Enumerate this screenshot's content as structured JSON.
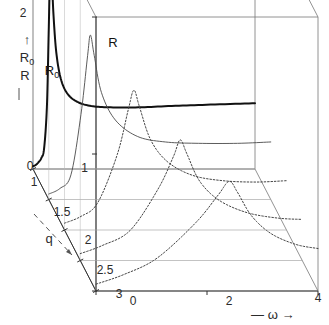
{
  "figure": {
    "type": "3d-waterfall-resonance-plot",
    "background": "#ffffff",
    "line_color": "#111111",
    "thin_line_color": "#4a4a4a",
    "box_color": "#777777"
  },
  "axes": {
    "y": {
      "label_top": "R",
      "label_top_sub": "0",
      "label_bottom": "R",
      "label_arrow": "↑",
      "ticks": [
        {
          "value": 2,
          "text": "2"
        },
        {
          "value": 1,
          "text": "1"
        },
        {
          "value": 0,
          "text": "0"
        }
      ],
      "range": [
        0,
        2
      ]
    },
    "x": {
      "label": "ω",
      "label_prefix": "—",
      "label_suffix": "→",
      "ticks": [
        {
          "value": 0,
          "text": "0"
        },
        {
          "value": 2,
          "text": "2"
        },
        {
          "value": 4,
          "text": "4"
        }
      ],
      "range": [
        0,
        4
      ]
    },
    "q": {
      "label": "q",
      "label_arrow": "↘",
      "ticks": [
        {
          "value": 1,
          "text": "1"
        },
        {
          "value": 1.5,
          "text": "1.5"
        },
        {
          "value": 2,
          "text": "2"
        },
        {
          "value": 2.5,
          "text": "2.5"
        },
        {
          "value": 3,
          "text": "3"
        }
      ],
      "range": [
        1,
        3
      ]
    }
  },
  "curve_labels": [
    {
      "name": "R-label",
      "text": "R",
      "x": 113,
      "y": 47
    },
    {
      "name": "R0-label",
      "text": "R",
      "sub": "0",
      "x": 52,
      "y": 75
    }
  ],
  "chart_data": {
    "type": "line",
    "title": "",
    "xlabel": "ω",
    "ylabel": "R0 / R",
    "zlabel": "q",
    "xlim": [
      0,
      4
    ],
    "ylim": [
      0,
      2
    ],
    "zlim": [
      1,
      3
    ],
    "grid": false,
    "legend": "none",
    "projection": "oblique-3d",
    "series": [
      {
        "name": "q=1 (R0, bold front slice)",
        "q": 1,
        "style": "solid-bold",
        "peak_omega": 0.32,
        "peak_value": 1.45,
        "x": [
          0.0,
          0.05,
          0.1,
          0.15,
          0.2,
          0.25,
          0.28,
          0.3,
          0.32,
          0.34,
          0.37,
          0.42,
          0.5,
          0.62,
          0.8,
          1.05,
          1.4,
          1.9,
          2.5,
          3.2,
          4.0
        ],
        "y": [
          0.02,
          0.03,
          0.05,
          0.08,
          0.15,
          0.45,
          0.95,
          1.3,
          1.45,
          1.38,
          1.12,
          0.85,
          0.66,
          0.55,
          0.49,
          0.46,
          0.45,
          0.45,
          0.46,
          0.47,
          0.48
        ]
      },
      {
        "name": "q=1 (R, thin flat slice)",
        "q": 1,
        "style": "solid-thin",
        "peak_omega": 0.3,
        "peak_value": 1.72,
        "x": [
          0.0,
          0.1,
          0.2,
          0.26,
          0.3,
          0.36,
          0.5,
          0.8,
          1.4,
          2.2,
          3.0,
          4.0
        ],
        "y": [
          2.0,
          2.0,
          1.98,
          1.9,
          1.78,
          1.7,
          1.68,
          1.67,
          1.67,
          1.67,
          1.67,
          1.67
        ]
      },
      {
        "name": "q=1.5",
        "q": 1.5,
        "style": "solid-thin",
        "peak_omega": 0.75,
        "peak_value": 1.2,
        "x": [
          0.0,
          0.2,
          0.4,
          0.58,
          0.7,
          0.75,
          0.82,
          0.95,
          1.2,
          1.6,
          2.1,
          2.7,
          3.4,
          4.0
        ],
        "y": [
          0.04,
          0.08,
          0.18,
          0.62,
          1.05,
          1.2,
          1.05,
          0.78,
          0.58,
          0.46,
          0.42,
          0.41,
          0.41,
          0.42
        ]
      },
      {
        "name": "q=2",
        "q": 2,
        "style": "dotted",
        "peak_omega": 1.25,
        "peak_value": 1.02,
        "x": [
          0.0,
          0.3,
          0.6,
          0.95,
          1.15,
          1.25,
          1.35,
          1.55,
          1.85,
          2.3,
          2.85,
          3.45,
          4.0
        ],
        "y": [
          0.05,
          0.1,
          0.2,
          0.55,
          0.88,
          1.02,
          0.9,
          0.66,
          0.5,
          0.4,
          0.36,
          0.35,
          0.36
        ]
      },
      {
        "name": "q=2.5",
        "q": 2.5,
        "style": "dotted",
        "peak_omega": 1.8,
        "peak_value": 0.88,
        "x": [
          0.0,
          0.4,
          0.9,
          1.4,
          1.68,
          1.8,
          1.92,
          2.15,
          2.5,
          3.0,
          3.55,
          4.0
        ],
        "y": [
          0.05,
          0.11,
          0.22,
          0.52,
          0.76,
          0.88,
          0.78,
          0.58,
          0.44,
          0.35,
          0.31,
          0.3
        ]
      },
      {
        "name": "q=3",
        "q": 3,
        "style": "dotted",
        "peak_omega": 2.4,
        "peak_value": 0.8,
        "x": [
          0.0,
          0.5,
          1.1,
          1.8,
          2.2,
          2.4,
          2.55,
          2.8,
          3.15,
          3.6,
          4.0
        ],
        "y": [
          0.05,
          0.12,
          0.24,
          0.5,
          0.7,
          0.8,
          0.72,
          0.55,
          0.42,
          0.34,
          0.31
        ]
      }
    ]
  }
}
